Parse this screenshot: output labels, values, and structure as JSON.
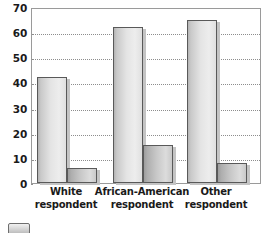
{
  "chart_data": {
    "type": "bar",
    "title": "",
    "subtitle": "",
    "xlabel": "",
    "ylabel": "",
    "ylim": [
      0,
      70
    ],
    "yticks": [
      0,
      10,
      20,
      30,
      40,
      50,
      60,
      70
    ],
    "ytick_labels": [
      "0",
      "10",
      "20",
      "30",
      "40",
      "50",
      "60",
      "70"
    ],
    "grid": true,
    "grid_style": "dotted-horizontal",
    "legend": "cropped-swatch-bottom-left",
    "categories": [
      "White respondent",
      "African-American respondent",
      "Other respondent"
    ],
    "category_lines": [
      [
        "White",
        "respondent"
      ],
      [
        "African-American",
        "respondent"
      ],
      [
        "Other",
        "respondent"
      ]
    ],
    "series": [
      {
        "name": "series-a",
        "values": [
          42,
          62,
          65
        ]
      },
      {
        "name": "series-b",
        "values": [
          6,
          15,
          8
        ]
      }
    ],
    "colors": {
      "series_a_fill": "#e4e4e4",
      "series_b_fill": "#c8c8c8",
      "bar_border": "#595959",
      "grid": "#8d8d8d",
      "frame": "#9a9a9a",
      "text": "#1a1a1a",
      "background": "#ffffff"
    },
    "geometry": {
      "plot_left": 31,
      "plot_top": 8,
      "plot_width": 230,
      "plot_height": 176,
      "group_centers": [
        66,
        142,
        216
      ],
      "bar_a_width": 30,
      "bar_b_width": 30
    }
  }
}
